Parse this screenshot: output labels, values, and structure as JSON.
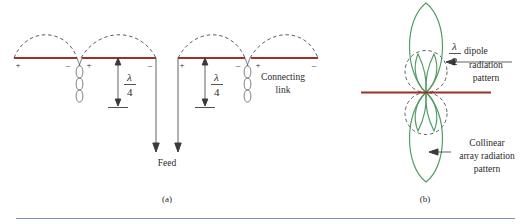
{
  "figure": {
    "background_color": "#ffffff",
    "dipole_color": "#9e3127",
    "pattern_color": "#4f9a63",
    "dash_color": "#4a4a55",
    "arrow_color": "#3a3a3a",
    "rule_color": "#7b93b4",
    "panels": [
      {
        "id": "panel-a",
        "label": "(a)",
        "x": 167,
        "y": 200
      },
      {
        "id": "panel-b",
        "label": "(b)",
        "x": 425,
        "y": 200
      }
    ],
    "panel_a": {
      "polarity_marks": [
        {
          "sign": "+",
          "x": 18,
          "y": 68
        },
        {
          "sign": "–",
          "x": 68,
          "y": 68
        },
        {
          "sign": "+",
          "x": 85,
          "y": 68
        },
        {
          "sign": "–",
          "x": 148,
          "y": 68
        },
        {
          "sign": "+",
          "x": 182,
          "y": 68
        },
        {
          "sign": "–",
          "x": 237,
          "y": 68
        },
        {
          "sign": "+",
          "x": 253,
          "y": 68
        },
        {
          "sign": "–",
          "x": 313,
          "y": 68
        }
      ],
      "dimension_labels": [
        {
          "numerator": "λ",
          "denominator": "4",
          "x": 118,
          "y": 80
        },
        {
          "numerator": "λ",
          "denominator": "4",
          "x": 205,
          "y": 80
        }
      ],
      "annotations": [
        {
          "id": "connecting-link",
          "lines": [
            "Connecting",
            "link"
          ],
          "x": 283,
          "y": 78
        },
        {
          "id": "feed",
          "lines": [
            "Feed"
          ],
          "x": 164,
          "y": 163
        }
      ]
    },
    "panel_b": {
      "annotations": [
        {
          "id": "half-wave-dipole-pattern",
          "fraction": {
            "numerator": "λ",
            "denominator": "2"
          },
          "lines": [
            "dipole",
            "radiation",
            "pattern"
          ],
          "x": 480,
          "y": 60
        },
        {
          "id": "collinear-array-pattern",
          "lines": [
            "Collinear",
            "array radiation",
            "pattern"
          ],
          "x": 480,
          "y": 146
        }
      ]
    }
  }
}
